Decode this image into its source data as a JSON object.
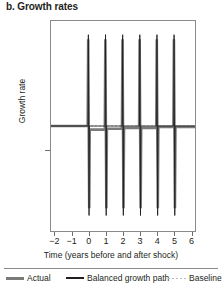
{
  "chart_data": {
    "type": "line",
    "title": "b. Growth rates",
    "xlabel": "Time (years before and after shock)",
    "ylabel": "Growth rate",
    "xlim": [
      -2.2,
      6.2
    ],
    "ylim": [
      -1.15,
      1.15
    ],
    "grid": false,
    "legend_position": "bottom",
    "x_ticks": [
      -2,
      -1,
      0,
      1,
      2,
      3,
      4,
      5,
      6
    ],
    "x_tick_labels": [
      "−2",
      "−1",
      "0",
      "1",
      "2",
      "3",
      "4",
      "5",
      "6"
    ],
    "y_ticks": [
      0
    ],
    "y_tick_labels": [
      ""
    ],
    "series": [
      {
        "name": "Actual",
        "style": "solid-thick-gray",
        "color": "#7a7a7a",
        "x": [
          -2.2,
          -0.06,
          -0.03,
          0.0,
          0.03,
          0.06,
          0.3,
          0.94,
          0.97,
          1.0,
          1.03,
          1.06,
          1.3,
          1.94,
          1.97,
          2.0,
          2.03,
          2.06,
          2.3,
          2.94,
          2.97,
          3.0,
          3.03,
          3.06,
          3.3,
          3.94,
          3.97,
          4.0,
          4.03,
          4.06,
          4.3,
          4.94,
          4.97,
          5.0,
          5.03,
          5.06,
          5.3,
          6.2
        ],
        "y": [
          0.0,
          0.0,
          0.95,
          0.0,
          -0.9,
          -0.04,
          -0.04,
          -0.04,
          0.95,
          -0.02,
          -0.9,
          -0.03,
          -0.03,
          -0.03,
          0.95,
          -0.01,
          -0.9,
          -0.02,
          -0.02,
          -0.02,
          0.95,
          -0.01,
          -0.9,
          -0.02,
          -0.02,
          -0.02,
          0.95,
          0.0,
          -0.9,
          -0.01,
          -0.01,
          -0.01,
          0.95,
          0.0,
          -0.9,
          -0.01,
          -0.01,
          -0.01
        ]
      },
      {
        "name": "Balanced growth path",
        "style": "solid-thin-black",
        "color": "#231f20",
        "x": [
          -2.2,
          -0.04,
          -0.02,
          0.0,
          0.02,
          0.04,
          0.5,
          0.96,
          0.98,
          1.0,
          1.02,
          1.04,
          1.5,
          1.96,
          1.98,
          2.0,
          2.02,
          2.04,
          2.5,
          2.96,
          2.98,
          3.0,
          3.02,
          3.04,
          3.5,
          3.96,
          3.98,
          4.0,
          4.02,
          4.04,
          4.5,
          4.96,
          4.98,
          5.0,
          5.02,
          5.04,
          5.5,
          6.2
        ],
        "y": [
          0.0,
          0.0,
          1.0,
          0.0,
          -0.98,
          0.0,
          0.0,
          0.0,
          1.0,
          0.0,
          -0.98,
          0.0,
          0.0,
          0.0,
          1.0,
          0.0,
          -0.98,
          0.0,
          0.0,
          0.0,
          1.0,
          0.0,
          -0.98,
          0.0,
          0.0,
          0.0,
          1.0,
          0.0,
          -0.98,
          0.0,
          0.0,
          0.0,
          1.0,
          0.0,
          -0.98,
          0.0,
          0.0,
          0.0
        ]
      },
      {
        "name": "Baseline",
        "style": "dotted-light-gray",
        "color": "#b9b9b9",
        "x": [
          -2.2,
          6.2
        ],
        "y": [
          0.0,
          0.0
        ]
      }
    ],
    "annotations": [],
    "spike_times": [
      0,
      1,
      2,
      3,
      4,
      5
    ]
  },
  "title": "b. Growth rates",
  "axes": {
    "y_label": "Growth rate",
    "x_label": "Time (years before and after shock)",
    "x_tick_labels": [
      "−2",
      "−1",
      "0",
      "1",
      "2",
      "3",
      "4",
      "5",
      "6"
    ]
  },
  "legend": {
    "items": [
      {
        "label": "Actual",
        "style": "solid-thick-gray",
        "color": "#7a7a7a"
      },
      {
        "label": "Balanced growth path",
        "style": "solid-thin-black",
        "color": "#231f20"
      },
      {
        "label": "Baseline",
        "style": "dotted-light-gray",
        "color": "#b9b9b9"
      }
    ]
  },
  "colors": {
    "actual": "#7a7a7a",
    "balanced_growth_path": "#231f20",
    "baseline": "#b9b9b9",
    "frame": "#8a8a8a",
    "text": "#231f20"
  }
}
